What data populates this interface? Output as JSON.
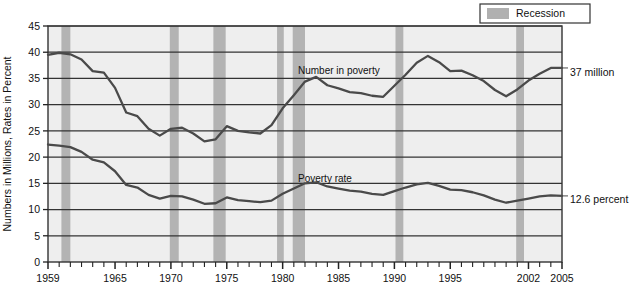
{
  "chart_data": {
    "type": "line",
    "title": "",
    "subtitle": "",
    "xlabel": "",
    "ylabel": "Numbers in Millions, Rates in Percent",
    "xlim": [
      1959,
      2005
    ],
    "ylim": [
      0,
      45
    ],
    "ytick_labels": [
      "0",
      "5",
      "10",
      "15",
      "20",
      "25",
      "30",
      "35",
      "40",
      "45"
    ],
    "ytick_values": [
      0,
      5,
      10,
      15,
      20,
      25,
      30,
      35,
      40,
      45
    ],
    "xtick_labels": [
      "1959",
      "1965",
      "1970",
      "1975",
      "1980",
      "1985",
      "1990",
      "1995",
      "2002",
      "2005"
    ],
    "xtick_values": [
      1959,
      1965,
      1970,
      1975,
      1980,
      1985,
      1990,
      1995,
      2002,
      2005
    ],
    "grid": true,
    "legend_position": "top-right",
    "x": [
      1959,
      1960,
      1961,
      1962,
      1963,
      1964,
      1965,
      1966,
      1967,
      1968,
      1969,
      1970,
      1971,
      1972,
      1973,
      1974,
      1975,
      1976,
      1977,
      1978,
      1979,
      1980,
      1981,
      1982,
      1983,
      1984,
      1985,
      1986,
      1987,
      1988,
      1989,
      1990,
      1991,
      1992,
      1993,
      1994,
      1995,
      1996,
      1997,
      1998,
      1999,
      2000,
      2001,
      2002,
      2003,
      2004,
      2005
    ],
    "series": [
      {
        "name": "Number in poverty",
        "annotation": "Number in poverty",
        "end_label": "37 million",
        "units": "millions",
        "values": [
          39.5,
          39.9,
          39.6,
          38.6,
          36.4,
          36.1,
          33.2,
          28.5,
          27.8,
          25.4,
          24.1,
          25.4,
          25.6,
          24.5,
          23.0,
          23.4,
          25.9,
          25.0,
          24.7,
          24.5,
          26.1,
          29.3,
          31.8,
          34.4,
          35.3,
          33.7,
          33.1,
          32.4,
          32.2,
          31.7,
          31.5,
          33.6,
          35.7,
          38.0,
          39.3,
          38.1,
          36.4,
          36.5,
          35.6,
          34.5,
          32.8,
          31.6,
          32.9,
          34.6,
          35.9,
          37.0,
          37.0
        ]
      },
      {
        "name": "Poverty rate",
        "annotation": "Poverty rate",
        "end_label": "12.6 percent",
        "units": "percent",
        "values": [
          22.4,
          22.2,
          21.9,
          21.0,
          19.5,
          19.0,
          17.3,
          14.7,
          14.2,
          12.8,
          12.1,
          12.6,
          12.5,
          11.9,
          11.1,
          11.2,
          12.3,
          11.8,
          11.6,
          11.4,
          11.7,
          13.0,
          14.0,
          15.0,
          15.2,
          14.4,
          14.0,
          13.6,
          13.4,
          13.0,
          12.8,
          13.5,
          14.2,
          14.8,
          15.1,
          14.5,
          13.8,
          13.7,
          13.3,
          12.7,
          11.9,
          11.3,
          11.7,
          12.1,
          12.5,
          12.7,
          12.6
        ]
      }
    ],
    "recessions": [
      {
        "label": "1960-61",
        "start": 1960.2,
        "end": 1961.0
      },
      {
        "label": "1969-70",
        "start": 1969.9,
        "end": 1970.7
      },
      {
        "label": "1973-75",
        "start": 1973.8,
        "end": 1974.9
      },
      {
        "label": "1980",
        "start": 1979.5,
        "end": 1980.1
      },
      {
        "label": "1981-82",
        "start": 1980.9,
        "end": 1982.0
      },
      {
        "label": "1990-91",
        "start": 1990.1,
        "end": 1990.8
      },
      {
        "label": "2001",
        "start": 2000.9,
        "end": 2001.6
      }
    ]
  },
  "legend": {
    "recession_label": "Recession",
    "swatch_color": "#b0b0b0"
  },
  "colors": {
    "line": "#4a4a4a",
    "recession_band": "#b3b3b3",
    "plot_background": "#eeeeee",
    "grid": "#333333",
    "frame": "#333333",
    "text": "#111111"
  }
}
